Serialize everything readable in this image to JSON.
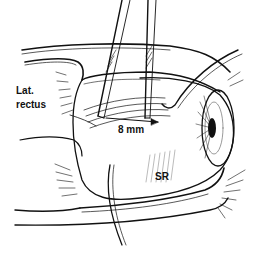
{
  "figure": {
    "type": "surgical line illustration",
    "labels": {
      "lateral_rectus_line1": "Lat.",
      "lateral_rectus_line2": "rectus",
      "measurement": "8 mm",
      "superior_rectus": "SR"
    },
    "colors": {
      "ink": "#111111",
      "background": "#ffffff",
      "shade": "#9a9a9a"
    }
  }
}
